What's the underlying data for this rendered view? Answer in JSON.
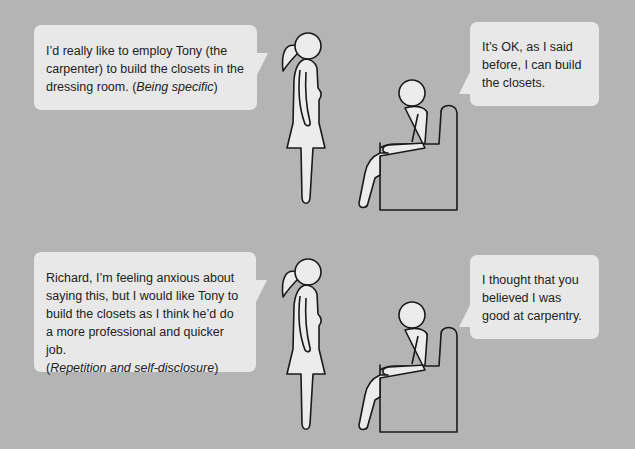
{
  "scenes": [
    {
      "woman_says": "I’d really like to employ Tony (the carpenter) to build the closets in the dressing room.",
      "technique": "Being specific",
      "man_says": "It’s OK, as I said before, I can build the closets."
    },
    {
      "woman_says": "Richard, I’m feeling anxious about saying this, but I would like Tony to build the closets as I think he’d do a more professional and quicker job.",
      "technique": "Repetition and self-disclosure",
      "man_says": "I thought that you believed I was good at carpentry."
    }
  ],
  "colors": {
    "background": "#b4b4b4",
    "bubble": "#e8e8e8",
    "figure_fill": "#ececec",
    "outline": "#1a1a1a"
  }
}
